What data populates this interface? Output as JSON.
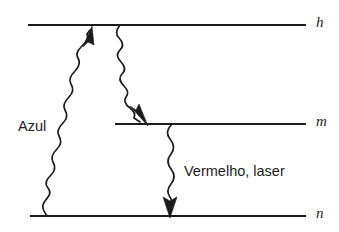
{
  "figure": {
    "type": "energy-level-diagram",
    "background_color": "#ffffff",
    "ink_color": "#1c1c1c"
  },
  "levels": [
    {
      "id": "h",
      "label": "h",
      "y": 25,
      "x_start": 28,
      "x_end": 306,
      "label_x": 316
    },
    {
      "id": "m",
      "label": "m",
      "y": 124,
      "x_start": 115,
      "x_end": 306,
      "label_x": 316
    },
    {
      "id": "n",
      "label": "n",
      "y": 216,
      "x_start": 30,
      "x_end": 306,
      "label_x": 316
    }
  ],
  "transitions": [
    {
      "id": "azul",
      "label": "Azul",
      "from_level": "n",
      "to_level": "h",
      "direction": "up",
      "label_x": 18,
      "label_y": 127,
      "start_x": 47,
      "start_y": 216,
      "end_x": 92,
      "end_y": 31
    },
    {
      "id": "h-to-m-decay",
      "label": "",
      "from_level": "h",
      "to_level": "m",
      "direction": "down",
      "start_x": 120,
      "start_y": 25,
      "end_x": 146,
      "end_y": 122
    },
    {
      "id": "vermelho-laser",
      "label": "Vermelho, laser",
      "from_level": "m",
      "to_level": "n",
      "direction": "down",
      "label_x": 184,
      "label_y": 172,
      "start_x": 172,
      "start_y": 124,
      "end_x": 170,
      "end_y": 214
    }
  ]
}
